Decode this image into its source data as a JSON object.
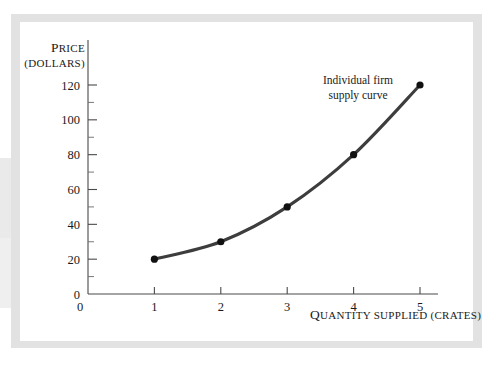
{
  "figure": {
    "panel_background": "#ffffff",
    "mat_color": "#e2e2e2"
  },
  "chart_data": {
    "type": "line",
    "title": "",
    "subtitle": "",
    "xlabel_main": "Q",
    "xlabel": "QUANTITY SUPPLIED (CRATES)",
    "xlabel_parts": {
      "lead": "Q",
      "rest": "UANTITY SUPPLIED ",
      "paren": "(CRATES)"
    },
    "ylabel": "PRICE",
    "ylabel_parts": {
      "lead": "P",
      "rest": "RICE"
    },
    "ylabel_units": "(DOLLARS)",
    "x": [
      1,
      2,
      3,
      4,
      5
    ],
    "values": [
      20,
      30,
      50,
      80,
      120
    ],
    "series": [
      {
        "name": "Individual firm supply curve",
        "values": [
          20,
          30,
          50,
          80,
          120
        ]
      }
    ],
    "xtick_labels": [
      "0",
      "1",
      "2",
      "3",
      "4",
      "5"
    ],
    "xtick_values": [
      0,
      1,
      2,
      3,
      4,
      5
    ],
    "ytick_labels": [
      "0",
      "20",
      "40",
      "60",
      "80",
      "100",
      "120"
    ],
    "ytick_values": [
      0,
      20,
      40,
      60,
      80,
      100,
      120
    ],
    "yminor_values": [
      10,
      30,
      50,
      70,
      90,
      110
    ],
    "xlim": [
      0,
      5.2
    ],
    "ylim": [
      0,
      130
    ],
    "grid": false,
    "legend": "none",
    "annotations": [
      {
        "text_line1": "Individual firm",
        "text_line2": "supply curve",
        "x": 358,
        "y": 84
      }
    ],
    "line_color": "#3d3d3d",
    "marker_color": "#111111",
    "axis_color": "#4a4a4a"
  }
}
